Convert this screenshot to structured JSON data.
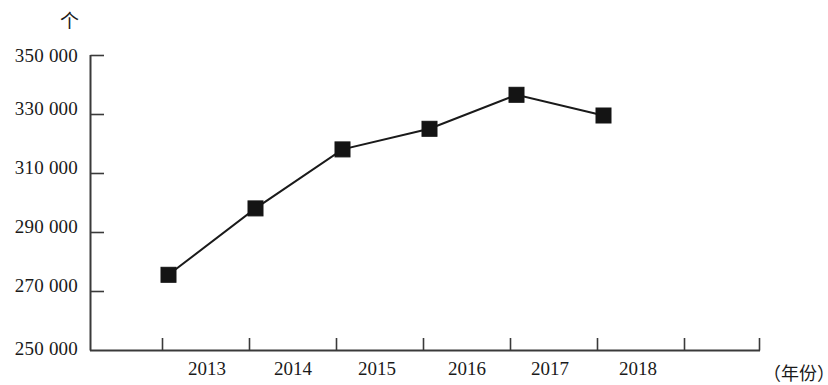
{
  "chart_data": {
    "type": "line",
    "title": "",
    "subtitle": "",
    "xlabel": "（年份）",
    "ylabel": "个",
    "categories": [
      "2013",
      "2014",
      "2015",
      "2016",
      "2017",
      "2018"
    ],
    "values": [
      275500,
      298000,
      318000,
      325000,
      336500,
      329500
    ],
    "series": [
      {
        "name": "",
        "values": [
          275500,
          298000,
          318000,
          325000,
          336500,
          329500
        ]
      }
    ],
    "ylim": [
      250000,
      350000
    ],
    "y_ticks": [
      "350 000",
      "330 000",
      "310 000",
      "290 000",
      "270 000",
      "250 000"
    ],
    "y_tick_values": [
      350000,
      330000,
      310000,
      290000,
      270000,
      250000
    ],
    "x_ticks": [
      "2013",
      "2014",
      "2015",
      "2016",
      "2017",
      "2018"
    ],
    "grid": false,
    "legend": "none",
    "marker": "square",
    "line_color": "#1a1a1a",
    "marker_color": "#141414",
    "axis_color": "#3a3a3a"
  },
  "axes": {
    "y_unit_label": "个",
    "x_axis_title": "（年份）"
  },
  "y_labels": {
    "t0": "350 000",
    "t1": "330 000",
    "t2": "310 000",
    "t3": "290 000",
    "t4": "270 000",
    "t5": "250 000"
  },
  "x_labels": {
    "c0": "2013",
    "c1": "2014",
    "c2": "2015",
    "c3": "2016",
    "c4": "2017",
    "c5": "2018"
  }
}
